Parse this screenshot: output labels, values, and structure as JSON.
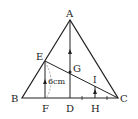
{
  "diagram": {
    "type": "geometry",
    "points": {
      "A": {
        "label": "A",
        "x": 70,
        "y": 20
      },
      "B": {
        "label": "B",
        "x": 22,
        "y": 98
      },
      "C": {
        "label": "C",
        "x": 118,
        "y": 98
      },
      "D": {
        "label": "D",
        "x": 70,
        "y": 98
      },
      "E": {
        "label": "E",
        "x": 45,
        "y": 61
      },
      "F": {
        "label": "F",
        "x": 45,
        "y": 98
      },
      "G": {
        "label": "G",
        "x": 70,
        "y": 72
      },
      "H": {
        "label": "H",
        "x": 95,
        "y": 98
      },
      "I": {
        "label": "I",
        "x": 95,
        "y": 85
      }
    },
    "measurement": {
      "segment": "EF",
      "label": "6cm"
    },
    "colors": {
      "stroke": "#222222",
      "dashed": "#888888",
      "background": "#ffffff"
    }
  }
}
